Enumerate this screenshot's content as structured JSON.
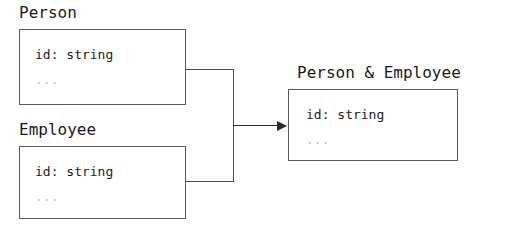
{
  "diagram": {
    "type": "type-intersection",
    "title": "",
    "background_color": "#ffffff",
    "border_color": "#5a5a5a",
    "text_color": "#1a1a1a",
    "muted_text_color": "#bcbcbc",
    "arrow_color": "#2b2b2b",
    "nodes": [
      {
        "id": "person",
        "label": "Person",
        "fields": [
          {
            "text": "id: string",
            "muted": false
          },
          {
            "text": "...",
            "muted": true
          }
        ]
      },
      {
        "id": "employee",
        "label": "Employee",
        "fields": [
          {
            "text": "id: string",
            "muted": false
          },
          {
            "text": "...",
            "muted": true
          }
        ]
      },
      {
        "id": "person-and-employee",
        "label": "Person & Employee",
        "fields": [
          {
            "text": "id: string",
            "muted": false
          },
          {
            "text": "...",
            "muted": true
          }
        ]
      }
    ],
    "edges": [
      {
        "from": "person",
        "to": "person-and-employee",
        "style": "bracket-arrow"
      },
      {
        "from": "employee",
        "to": "person-and-employee",
        "style": "bracket-arrow"
      }
    ]
  }
}
